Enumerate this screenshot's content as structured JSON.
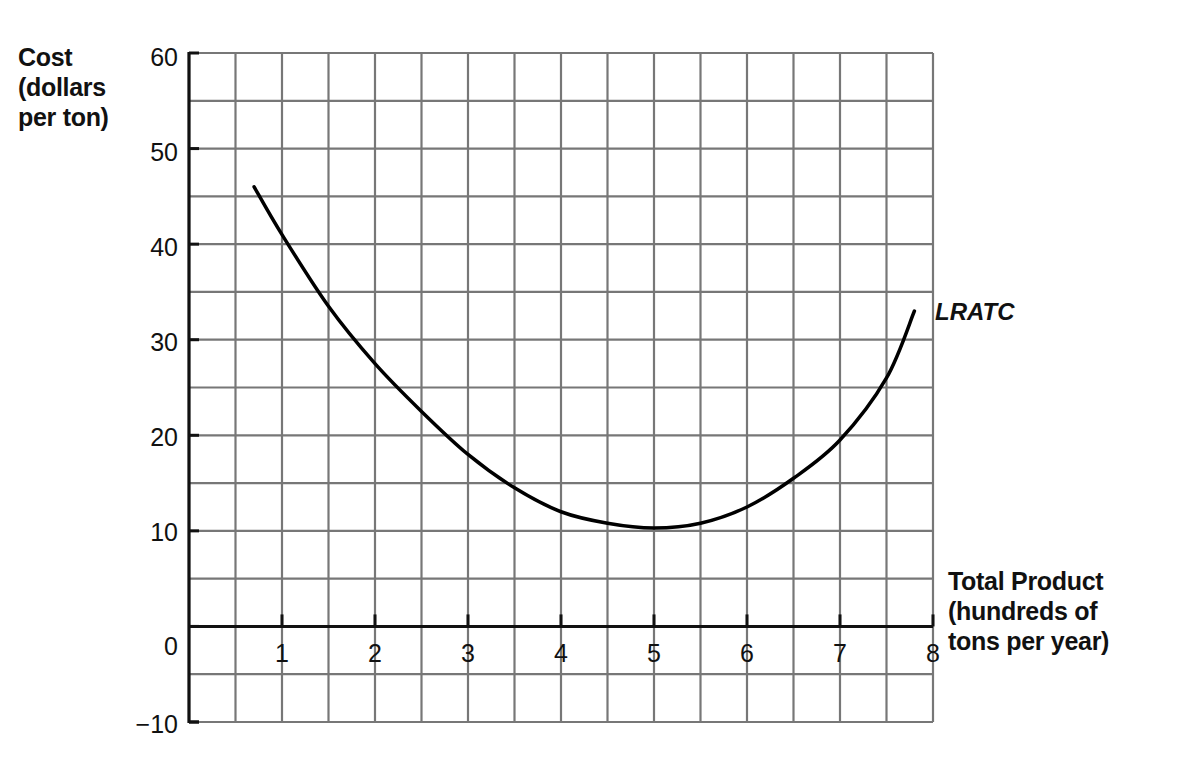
{
  "chart_data": {
    "type": "line",
    "title": "",
    "ylabel_lines": [
      "Cost",
      "(dollars",
      "per ton)"
    ],
    "xlabel_lines": [
      "Total Product",
      "(hundreds of",
      "tons per year)"
    ],
    "ylabel": "Cost (dollars per ton)",
    "xlabel": "Total Product (hundreds of tons per year)",
    "ylim": [
      -10,
      60
    ],
    "xlim": [
      0,
      8
    ],
    "y_ticks": [
      60,
      50,
      40,
      30,
      20,
      10,
      0,
      -10
    ],
    "y_tick_labels": [
      "60",
      "50",
      "40",
      "30",
      "20",
      "10",
      "0",
      "−10"
    ],
    "x_ticks": [
      1,
      2,
      3,
      4,
      5,
      6,
      7,
      8
    ],
    "x_tick_labels": [
      "1",
      "2",
      "3",
      "4",
      "5",
      "6",
      "7",
      "8"
    ],
    "grid": true,
    "grid_step_x": 0.5,
    "grid_step_y": 5,
    "series": [
      {
        "name": "LRATC",
        "x": [
          0.7,
          1,
          1.5,
          2,
          2.5,
          3,
          3.5,
          4,
          4.5,
          5,
          5.5,
          6,
          6.5,
          7,
          7.5,
          7.8
        ],
        "values": [
          46,
          41,
          33.5,
          27.5,
          22.5,
          18,
          14.5,
          12,
          10.8,
          10.3,
          10.8,
          12.5,
          15.5,
          19.5,
          26,
          33
        ]
      }
    ],
    "annotations": [
      {
        "text": "LRATC",
        "x": 7.9,
        "y": 34,
        "style": "bold italic"
      }
    ],
    "colors": {
      "grid": "#777777",
      "axis": "#111111",
      "curve": "#000000"
    }
  }
}
